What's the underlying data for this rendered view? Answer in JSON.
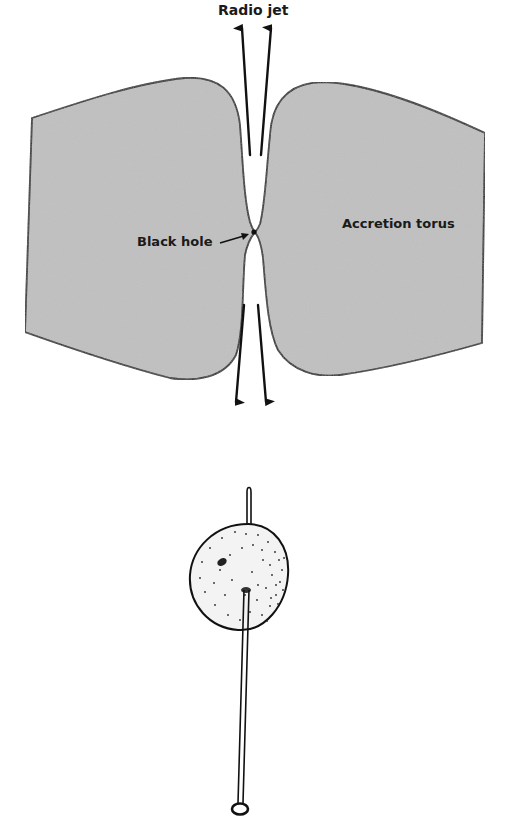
{
  "diagram": {
    "labels": {
      "radio_jet": "Radio jet",
      "black_hole": "Black hole",
      "accretion_torus": "Accretion torus"
    },
    "colors": {
      "torus_fill": "#c3c3c3",
      "outline": "#1b1b1b",
      "background": "#ffffff",
      "bead_fill": "#f2f2f2"
    },
    "elements": [
      {
        "name": "accretion-torus-left",
        "type": "shaded-region"
      },
      {
        "name": "accretion-torus-right",
        "type": "shaded-region"
      },
      {
        "name": "black-hole",
        "type": "point"
      },
      {
        "name": "radio-jet-arrows-up",
        "count": 2
      },
      {
        "name": "radio-jet-arrows-down",
        "count": 2
      },
      {
        "name": "pin-through-bead-analogy",
        "type": "illustration"
      }
    ]
  }
}
